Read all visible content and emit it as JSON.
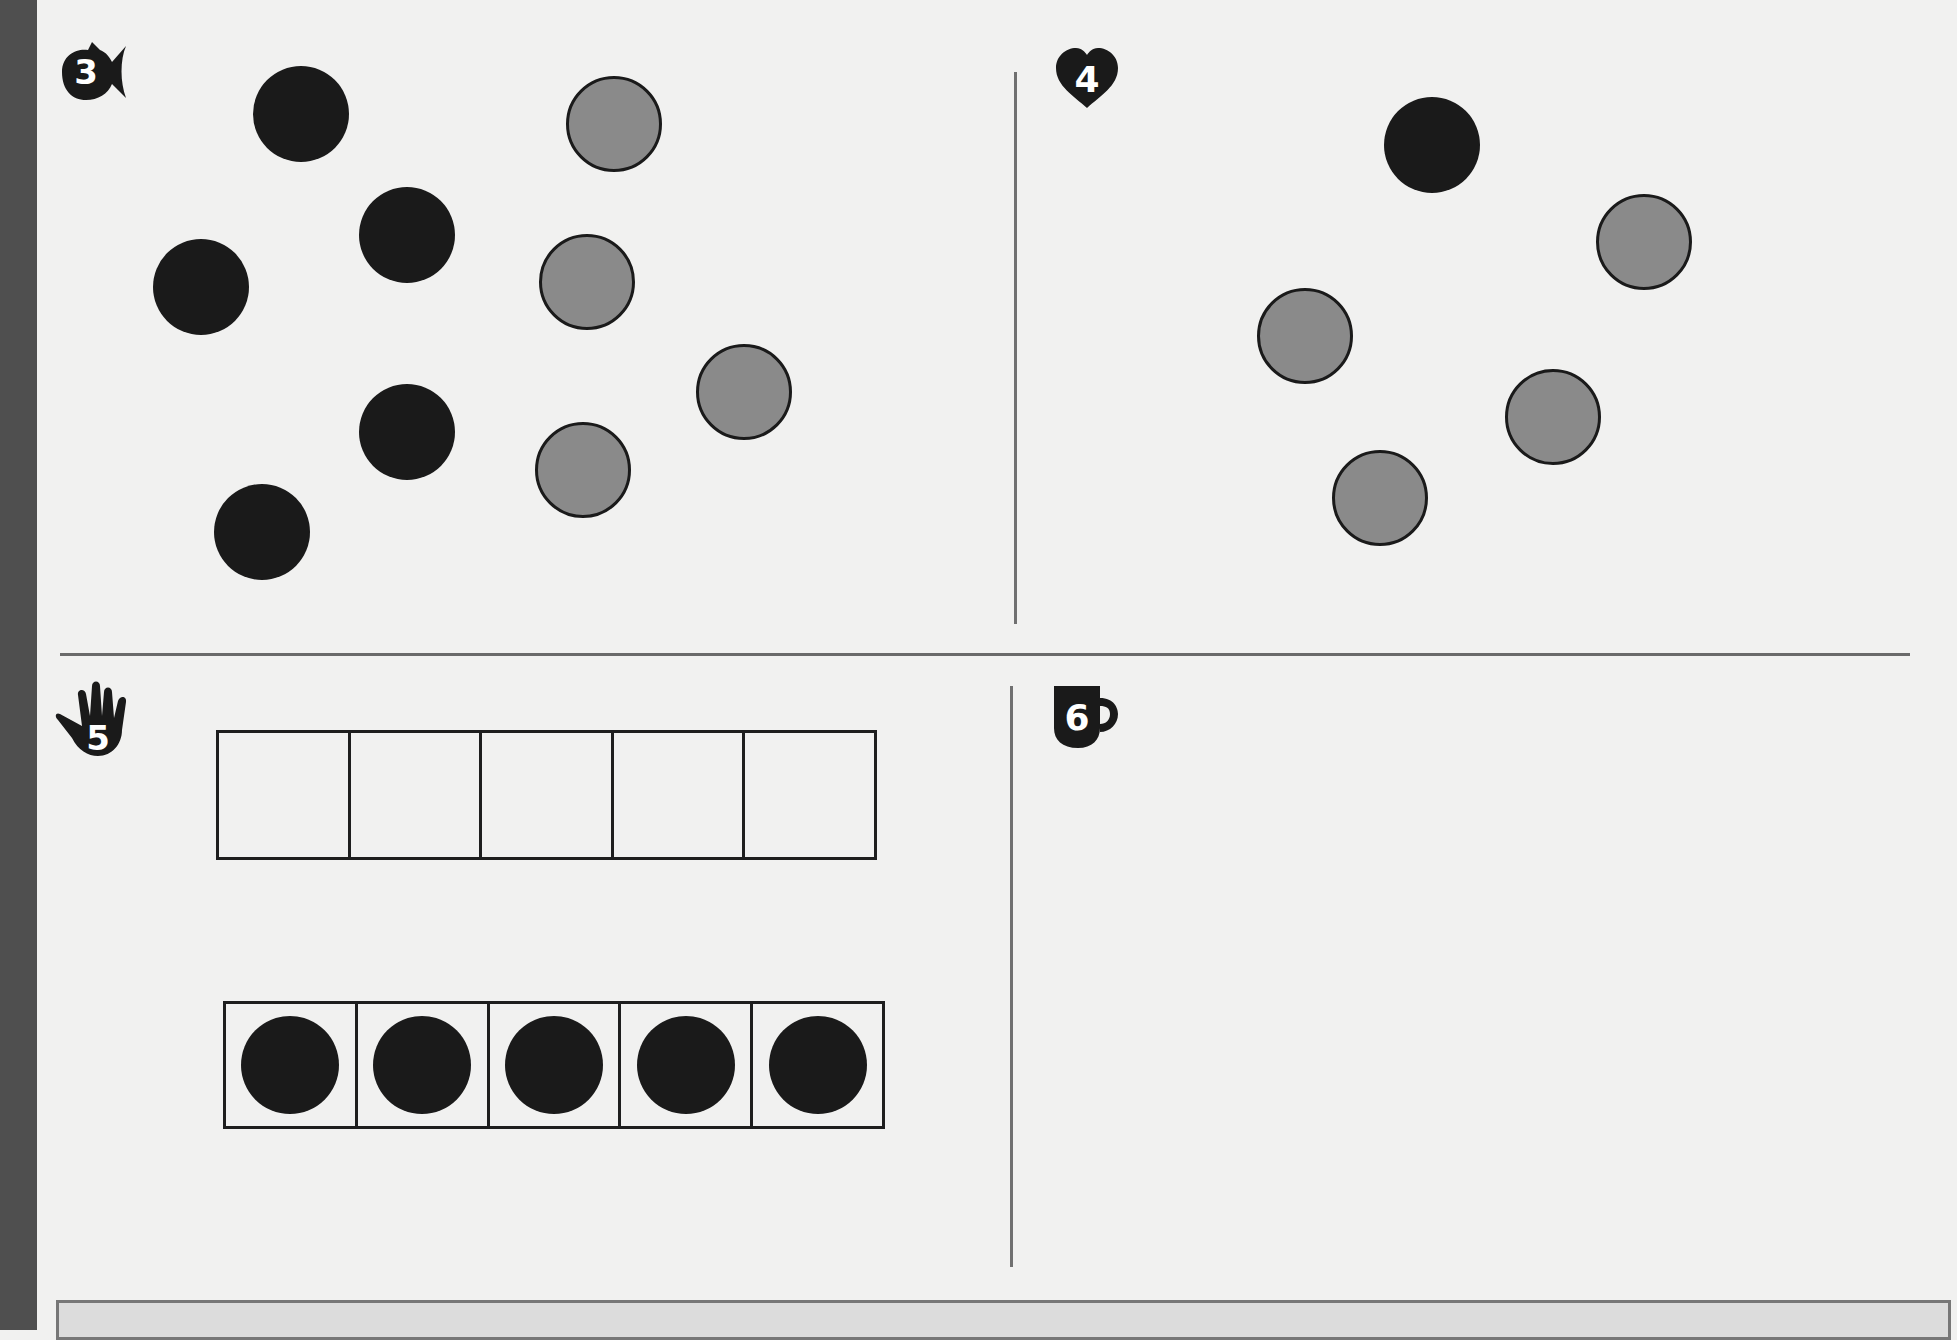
{
  "page": {
    "background": "#f1f1f0",
    "ink": "#1a1a1a",
    "counter_grey": "#8a8a8a"
  },
  "problems": [
    {
      "number": "3",
      "badge_icon": "fish-icon",
      "counters": {
        "black": [
          [
            301,
            114
          ],
          [
            407,
            235
          ],
          [
            201,
            287
          ],
          [
            407,
            432
          ],
          [
            262,
            532
          ]
        ],
        "grey": [
          [
            614,
            124
          ],
          [
            587,
            282
          ],
          [
            744,
            392
          ],
          [
            583,
            470
          ]
        ]
      }
    },
    {
      "number": "4",
      "badge_icon": "heart-icon",
      "counters": {
        "black": [
          [
            1432,
            145
          ]
        ],
        "grey": [
          [
            1644,
            242
          ],
          [
            1305,
            336
          ],
          [
            1553,
            417
          ],
          [
            1380,
            498
          ]
        ]
      }
    },
    {
      "number": "5",
      "badge_icon": "hand-icon",
      "frames": [
        {
          "cells": 5,
          "filled": 0
        },
        {
          "cells": 5,
          "filled": 5
        }
      ]
    },
    {
      "number": "6",
      "badge_icon": "mug-icon"
    }
  ]
}
